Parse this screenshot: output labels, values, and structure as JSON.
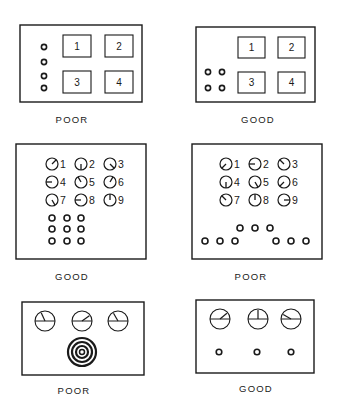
{
  "colors": {
    "ink": "#1a1a1a",
    "background": "#ffffff"
  },
  "panels": [
    {
      "id": "A-poor",
      "rating": "POOR",
      "box": [
        20,
        25,
        122,
        77
      ],
      "caption_pos": [
        72,
        122
      ],
      "displays": [
        {
          "label": "1",
          "x": 63,
          "y": 35,
          "w": 28,
          "h": 22
        },
        {
          "label": "2",
          "x": 105,
          "y": 35,
          "w": 28,
          "h": 22
        },
        {
          "label": "3",
          "x": 63,
          "y": 71,
          "w": 28,
          "h": 22
        },
        {
          "label": "4",
          "x": 105,
          "y": 71,
          "w": 28,
          "h": 22
        }
      ],
      "knobs": [
        [
          44,
          47
        ],
        [
          44,
          62
        ],
        [
          44,
          76
        ],
        [
          44,
          88
        ]
      ],
      "knob_r": 2.6
    },
    {
      "id": "A-good",
      "rating": "GOOD",
      "box": [
        196,
        27,
        119,
        75
      ],
      "caption_pos": [
        258,
        122
      ],
      "displays": [
        {
          "label": "1",
          "x": 238,
          "y": 37,
          "w": 27,
          "h": 21
        },
        {
          "label": "2",
          "x": 278,
          "y": 37,
          "w": 27,
          "h": 21
        },
        {
          "label": "3",
          "x": 238,
          "y": 72,
          "w": 27,
          "h": 21
        },
        {
          "label": "4",
          "x": 278,
          "y": 72,
          "w": 27,
          "h": 21
        }
      ],
      "knobs": [
        [
          208,
          72
        ],
        [
          222,
          72
        ],
        [
          208,
          88
        ],
        [
          222,
          88
        ]
      ],
      "knob_r": 2.6
    },
    {
      "id": "B-good",
      "rating": "GOOD",
      "box": [
        16,
        144,
        130,
        115
      ],
      "caption_pos": [
        72,
        279
      ],
      "dials": [
        {
          "label": "1",
          "x": 52,
          "y": 164,
          "angle": 45
        },
        {
          "label": "2",
          "x": 81,
          "y": 164,
          "angle": 180
        },
        {
          "label": "3",
          "x": 110,
          "y": 164,
          "angle": 135
        },
        {
          "label": "4",
          "x": 52,
          "y": 182,
          "angle": 270
        },
        {
          "label": "5",
          "x": 81,
          "y": 182,
          "angle": 330
        },
        {
          "label": "6",
          "x": 110,
          "y": 182,
          "angle": 30
        },
        {
          "label": "7",
          "x": 52,
          "y": 200,
          "angle": 150
        },
        {
          "label": "8",
          "x": 81,
          "y": 200,
          "angle": 270
        },
        {
          "label": "9",
          "x": 110,
          "y": 200,
          "angle": 0
        }
      ],
      "dial_r": 6,
      "knobs": [
        [
          52,
          218
        ],
        [
          67,
          218
        ],
        [
          81,
          218
        ],
        [
          52,
          229
        ],
        [
          67,
          229
        ],
        [
          81,
          229
        ],
        [
          52,
          241
        ],
        [
          67,
          241
        ],
        [
          81,
          241
        ]
      ],
      "knob_r": 3
    },
    {
      "id": "B-poor",
      "rating": "POOR",
      "box": [
        192,
        144,
        130,
        115
      ],
      "caption_pos": [
        251,
        279
      ],
      "dials": [
        {
          "label": "1",
          "x": 226,
          "y": 164,
          "angle": 225
        },
        {
          "label": "2",
          "x": 255,
          "y": 164,
          "angle": 270
        },
        {
          "label": "3",
          "x": 284,
          "y": 164,
          "angle": 315
        },
        {
          "label": "4",
          "x": 226,
          "y": 182,
          "angle": 180
        },
        {
          "label": "5",
          "x": 255,
          "y": 182,
          "angle": 150
        },
        {
          "label": "6",
          "x": 284,
          "y": 182,
          "angle": 225
        },
        {
          "label": "7",
          "x": 226,
          "y": 200,
          "angle": 315
        },
        {
          "label": "8",
          "x": 255,
          "y": 200,
          "angle": 0
        },
        {
          "label": "9",
          "x": 284,
          "y": 200,
          "angle": 90
        }
      ],
      "dial_r": 6,
      "knobs": [
        [
          205,
          241
        ],
        [
          220,
          241
        ],
        [
          235,
          241
        ],
        [
          240,
          228
        ],
        [
          255,
          228
        ],
        [
          270,
          228
        ],
        [
          276,
          241
        ],
        [
          291,
          241
        ],
        [
          306,
          241
        ]
      ],
      "knob_r": 3
    },
    {
      "id": "C-poor",
      "rating": "POOR",
      "box": [
        22,
        302,
        122,
        73
      ],
      "caption_pos": [
        74,
        393
      ],
      "meters": [
        {
          "x": 45,
          "y": 321,
          "angle": 335
        },
        {
          "x": 82,
          "y": 321,
          "angle": 55
        },
        {
          "x": 118,
          "y": 321,
          "angle": 330
        }
      ],
      "meter_r": 10,
      "concentric": {
        "x": 82,
        "y": 352,
        "rings": [
          14,
          10,
          6,
          2.5
        ]
      }
    },
    {
      "id": "C-good",
      "rating": "GOOD",
      "box": [
        196,
        300,
        118,
        73
      ],
      "caption_pos": [
        256,
        391
      ],
      "meters": [
        {
          "x": 220,
          "y": 319,
          "angle": 50
        },
        {
          "x": 258,
          "y": 319,
          "angle": 0
        },
        {
          "x": 291,
          "y": 319,
          "angle": 300
        }
      ],
      "meter_r": 10,
      "knobs": [
        [
          219,
          352
        ],
        [
          257,
          352
        ],
        [
          291,
          352
        ]
      ],
      "knob_r": 2.8
    }
  ]
}
